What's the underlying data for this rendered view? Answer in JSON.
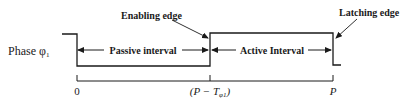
{
  "diagram": {
    "signal_label": "Phase φ",
    "signal_subscript": "1",
    "annotations": {
      "enabling_edge": "Enabling edge",
      "latching_edge": "Latching edge"
    },
    "intervals": {
      "passive": "Passive interval",
      "active": "Active Interval"
    },
    "axis": {
      "tick_start": "0",
      "tick_mid_prefix": "(P − T",
      "tick_mid_sub": "φ1",
      "tick_mid_suffix": ")",
      "tick_end": "P"
    },
    "colors": {
      "line": "#1a1a1a",
      "background": "#ffffff"
    }
  }
}
